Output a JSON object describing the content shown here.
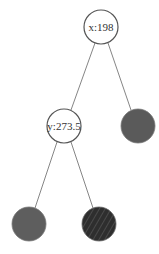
{
  "diagram": {
    "type": "binary-tree",
    "nodes": [
      {
        "id": "root",
        "label": "x:198",
        "cx": 101,
        "cy": 27,
        "r": 17,
        "fill": "#ffffff",
        "kind": "split"
      },
      {
        "id": "left",
        "label": "y:273.5",
        "cx": 64,
        "cy": 126,
        "r": 17,
        "fill": "#ffffff",
        "kind": "split"
      },
      {
        "id": "right",
        "label": "",
        "cx": 138,
        "cy": 126,
        "r": 17,
        "fill": "#5a5a5a",
        "kind": "leaf"
      },
      {
        "id": "left-left",
        "label": "",
        "cx": 29,
        "cy": 224,
        "r": 17,
        "fill": "#5e5e5e",
        "kind": "leaf"
      },
      {
        "id": "left-right",
        "label": "",
        "cx": 99,
        "cy": 224,
        "r": 17,
        "fill": "#333333",
        "kind": "leaf-striped"
      }
    ],
    "edges": [
      {
        "from": "root",
        "to": "left"
      },
      {
        "from": "root",
        "to": "right"
      },
      {
        "from": "left",
        "to": "left-left"
      },
      {
        "from": "left",
        "to": "left-right"
      }
    ],
    "colors": {
      "stroke": "#555555",
      "edge": "#666666",
      "stripe": "#4a4a4a"
    }
  }
}
